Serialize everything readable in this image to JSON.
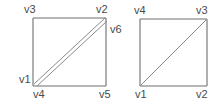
{
  "figure": {
    "background_color": "#ffffff",
    "line_color": "#6e6e6e",
    "text_color": "#4a4a4a",
    "shapes": [
      {
        "name": "left-square",
        "x": 33,
        "y": 18,
        "width": 73,
        "height": 68,
        "diagonal": "double",
        "diagonal_from": "bottom-left",
        "diagonal_to": "top-right"
      },
      {
        "name": "right-square",
        "x": 140,
        "y": 19,
        "width": 67,
        "height": 67,
        "diagonal": "single",
        "diagonal_from": "bottom-left",
        "diagonal_to": "top-right"
      }
    ],
    "labels": [
      {
        "name": "left-label-v3",
        "text": "v3",
        "x": 24,
        "y": 4
      },
      {
        "name": "left-label-v2",
        "text": "v2",
        "x": 96,
        "y": 4
      },
      {
        "name": "left-label-v6",
        "text": "v6",
        "x": 110,
        "y": 24
      },
      {
        "name": "left-label-v1",
        "text": "v1",
        "x": 19,
        "y": 74
      },
      {
        "name": "left-label-v4",
        "text": "v4",
        "x": 33,
        "y": 89
      },
      {
        "name": "left-label-v5",
        "text": "v5",
        "x": 99,
        "y": 89
      },
      {
        "name": "right-label-v4",
        "text": "v4",
        "x": 134,
        "y": 5
      },
      {
        "name": "right-label-v3",
        "text": "v3",
        "x": 196,
        "y": 5
      },
      {
        "name": "right-label-v1",
        "text": "v1",
        "x": 135,
        "y": 89
      },
      {
        "name": "right-label-v2",
        "text": "v2",
        "x": 196,
        "y": 89
      }
    ]
  }
}
